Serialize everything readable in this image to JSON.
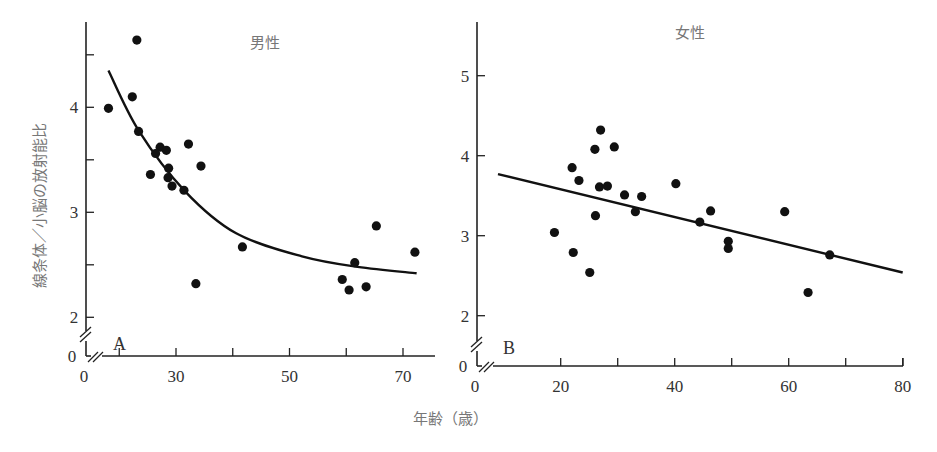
{
  "chart_data": [
    {
      "type": "scatter",
      "panel_letter": "A",
      "title": "男性",
      "xlabel": "年齢（歳）",
      "ylabel": "線条体／小脳の放射能比",
      "xlim": [
        10,
        76
      ],
      "ylim": [
        1.75,
        4.85
      ],
      "x_ticks": [
        20,
        30,
        40,
        50,
        60,
        70
      ],
      "x_tick_labels": [
        "",
        "30",
        "",
        "50",
        "",
        "70"
      ],
      "y_ticks": [
        2,
        2.5,
        3,
        3.5,
        4,
        4.5
      ],
      "y_tick_labels": [
        "2",
        "",
        "3",
        "",
        "4",
        ""
      ],
      "axis_break": true,
      "origin_labels": {
        "x": "0",
        "y": "0"
      },
      "points": [
        {
          "x": 18.1,
          "y": 3.99
        },
        {
          "x": 23.1,
          "y": 4.64
        },
        {
          "x": 22.3,
          "y": 4.1
        },
        {
          "x": 23.4,
          "y": 3.77
        },
        {
          "x": 32.2,
          "y": 3.65
        },
        {
          "x": 27.2,
          "y": 3.62
        },
        {
          "x": 28.3,
          "y": 3.59
        },
        {
          "x": 26.4,
          "y": 3.56
        },
        {
          "x": 34.4,
          "y": 3.44
        },
        {
          "x": 25.5,
          "y": 3.36
        },
        {
          "x": 28.7,
          "y": 3.42
        },
        {
          "x": 28.6,
          "y": 3.33
        },
        {
          "x": 29.3,
          "y": 3.25
        },
        {
          "x": 31.4,
          "y": 3.21
        },
        {
          "x": 33.5,
          "y": 2.32
        },
        {
          "x": 41.7,
          "y": 2.67
        },
        {
          "x": 65.3,
          "y": 2.87
        },
        {
          "x": 72.1,
          "y": 2.62
        },
        {
          "x": 61.5,
          "y": 2.52
        },
        {
          "x": 59.3,
          "y": 2.36
        },
        {
          "x": 60.5,
          "y": 2.26
        },
        {
          "x": 63.5,
          "y": 2.29
        }
      ],
      "fit": {
        "kind": "exponential-decay",
        "curve": [
          {
            "x": 18.1,
            "y": 4.35
          },
          {
            "x": 23.4,
            "y": 3.78
          },
          {
            "x": 31.6,
            "y": 3.2
          },
          {
            "x": 40.6,
            "y": 2.8
          },
          {
            "x": 52.2,
            "y": 2.58
          },
          {
            "x": 62.0,
            "y": 2.48
          },
          {
            "x": 72.4,
            "y": 2.42
          }
        ]
      }
    },
    {
      "type": "scatter",
      "panel_letter": "B",
      "title": "女性",
      "xlabel": "年齢（歳）",
      "ylabel": "",
      "xlim": [
        0,
        80
      ],
      "ylim": [
        1.6,
        5.7
      ],
      "x_ticks": [
        20,
        30,
        40,
        50,
        60,
        70,
        80
      ],
      "x_tick_labels": [
        "20",
        "",
        "40",
        "",
        "60",
        "",
        "80"
      ],
      "y_ticks": [
        2,
        3,
        4,
        5
      ],
      "y_tick_labels": [
        "2",
        "3",
        "4",
        "5"
      ],
      "axis_break": true,
      "origin_labels": {
        "x": "0",
        "y": "0"
      },
      "points": [
        {
          "x": 27.0,
          "y": 4.32
        },
        {
          "x": 26.0,
          "y": 4.08
        },
        {
          "x": 29.4,
          "y": 4.11
        },
        {
          "x": 22.0,
          "y": 3.85
        },
        {
          "x": 23.2,
          "y": 3.69
        },
        {
          "x": 26.8,
          "y": 3.61
        },
        {
          "x": 28.2,
          "y": 3.62
        },
        {
          "x": 31.2,
          "y": 3.51
        },
        {
          "x": 34.2,
          "y": 3.49
        },
        {
          "x": 33.1,
          "y": 3.3
        },
        {
          "x": 26.1,
          "y": 3.25
        },
        {
          "x": 18.9,
          "y": 3.04
        },
        {
          "x": 22.2,
          "y": 2.79
        },
        {
          "x": 25.1,
          "y": 2.54
        },
        {
          "x": 40.2,
          "y": 3.65
        },
        {
          "x": 46.3,
          "y": 3.31
        },
        {
          "x": 44.4,
          "y": 3.17
        },
        {
          "x": 49.4,
          "y": 2.93
        },
        {
          "x": 49.4,
          "y": 2.84
        },
        {
          "x": 59.3,
          "y": 3.3
        },
        {
          "x": 67.2,
          "y": 2.76
        },
        {
          "x": 63.4,
          "y": 2.29
        }
      ],
      "fit": {
        "kind": "linear",
        "curve": [
          {
            "x": 9.0,
            "y": 3.77
          },
          {
            "x": 80.0,
            "y": 2.54
          }
        ]
      }
    }
  ],
  "shared_xlabel": "年齢（歳）",
  "shared_ylabel": "線条体／小脳の放射能比"
}
